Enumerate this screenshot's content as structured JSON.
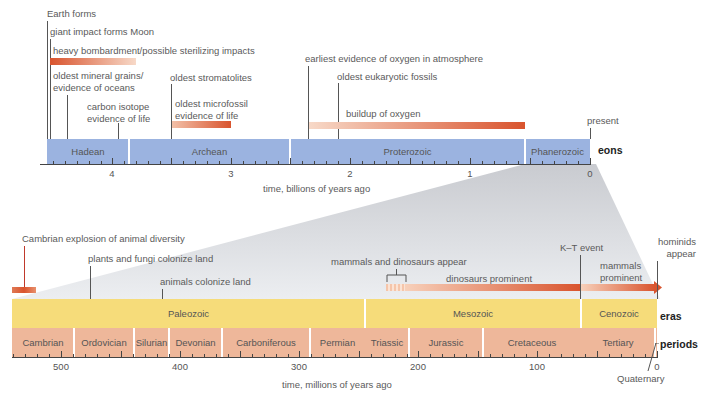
{
  "eon_timeline": {
    "axis_label": "time, billions of years ago",
    "row_label": "eons",
    "present_label": "present",
    "ticks": [
      {
        "label": "4",
        "value": 4
      },
      {
        "label": "3",
        "value": 3
      },
      {
        "label": "2",
        "value": 2
      },
      {
        "label": "1",
        "value": 1
      },
      {
        "label": "0",
        "value": 0
      }
    ],
    "eons": [
      {
        "name": "Hadean",
        "start": 4.6,
        "end": 4.0
      },
      {
        "name": "Archean",
        "start": 4.0,
        "end": 2.5
      },
      {
        "name": "Proterozoic",
        "start": 2.5,
        "end": 0.54
      },
      {
        "name": "Phanerozoic",
        "start": 0.54,
        "end": 0
      }
    ],
    "events": [
      {
        "label": "Earth forms",
        "time": 4.6
      },
      {
        "label": "giant impact forms Moon",
        "time": 4.55
      },
      {
        "label": "heavy bombardment/possible sterilizing impacts",
        "range": [
          4.55,
          3.8
        ]
      },
      {
        "label": "oldest mineral grains/",
        "label2": "evidence of oceans",
        "time": 4.4
      },
      {
        "label": "carbon isotope",
        "label2": "evidence of life",
        "time": 3.85
      },
      {
        "label": "oldest stromatolites",
        "time": 3.5
      },
      {
        "label": "oldest microfossil",
        "label2": "evidence of life",
        "range": [
          3.5,
          3.0
        ]
      },
      {
        "label": "earliest evidence of oxygen in atmosphere",
        "time": 2.4
      },
      {
        "label": "oldest eukaryotic fossils",
        "time": 2.1
      },
      {
        "label": "buildup of oxygen",
        "range": [
          2.4,
          0.55
        ]
      }
    ]
  },
  "era_timeline": {
    "axis_label": "time, millions of years ago",
    "era_row_label": "eras",
    "period_row_label": "periods",
    "quaternary_label": "Quaternary",
    "ticks": [
      {
        "label": "500",
        "value": 500
      },
      {
        "label": "400",
        "value": 400
      },
      {
        "label": "300",
        "value": 300
      },
      {
        "label": "200",
        "value": 200
      },
      {
        "label": "100",
        "value": 100
      },
      {
        "label": "0",
        "value": 0
      }
    ],
    "eras": [
      {
        "name": "Paleozoic",
        "start": 542,
        "end": 251
      },
      {
        "name": "Mesozoic",
        "start": 251,
        "end": 65
      },
      {
        "name": "Cenozoic",
        "start": 65,
        "end": 0
      }
    ],
    "periods": [
      {
        "name": "Cambrian",
        "start": 542,
        "end": 488
      },
      {
        "name": "Ordovician",
        "start": 488,
        "end": 444
      },
      {
        "name": "Silurian",
        "start": 444,
        "end": 416
      },
      {
        "name": "Devonian",
        "start": 416,
        "end": 359
      },
      {
        "name": "Carboniferous",
        "start": 359,
        "end": 299
      },
      {
        "name": "Permian",
        "start": 299,
        "end": 251
      },
      {
        "name": "Triassic",
        "start": 251,
        "end": 200
      },
      {
        "name": "Jurassic",
        "start": 200,
        "end": 146
      },
      {
        "name": "Cretaceous",
        "start": 146,
        "end": 65
      },
      {
        "name": "Tertiary",
        "start": 65,
        "end": 2
      }
    ],
    "events": [
      {
        "label": "Cambrian explosion of animal diversity",
        "time": 535
      },
      {
        "label": "plants and fungi colonize land",
        "time": 475
      },
      {
        "label": "animals colonize land",
        "time": 415
      },
      {
        "label": "mammals and dinosaurs appear",
        "range": [
          225,
          200
        ]
      },
      {
        "label": "dinosaurs prominent",
        "range": [
          200,
          65
        ]
      },
      {
        "label": "K–T event",
        "time": 65
      },
      {
        "label": "mammals",
        "label2": "prominent",
        "range": [
          65,
          0
        ]
      },
      {
        "label": "hominids",
        "label2": "appear",
        "time": 6
      }
    ]
  },
  "colors": {
    "eon_fill": "#9bb3e0",
    "era_fill": "#f6dc7a",
    "period_fill": "#eeb79a",
    "event_bar_dark": "#d9542e",
    "event_bar_light": "#f7d9c8",
    "zoom_wedge": "#dcdde1"
  }
}
